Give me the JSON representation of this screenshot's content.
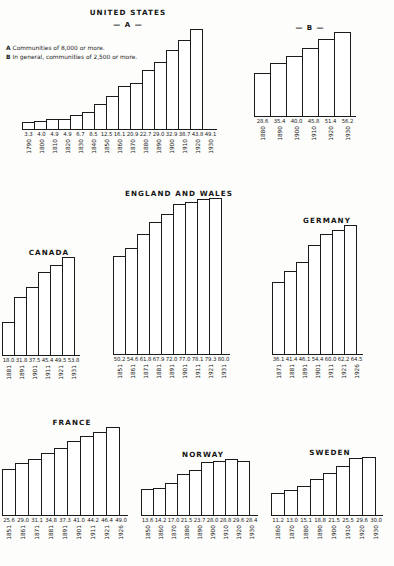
{
  "legend": {
    "lines": [
      {
        "key": "A",
        "text": "Communities of 8,000 or more."
      },
      {
        "key": "B",
        "text": "In general, communities of 2,500 or more."
      }
    ]
  },
  "chart_data": [
    {
      "type": "bar",
      "title": "UNITED STATES",
      "subtitle": "— A —",
      "xlabel": "",
      "ylabel": "Per cent urban",
      "ylim": [
        0,
        56.2
      ],
      "grid": false,
      "legend": "none",
      "categories": [
        "1790",
        "1800",
        "1810",
        "1820",
        "1830",
        "1840",
        "1850",
        "1860",
        "1870",
        "1880",
        "1890",
        "1900",
        "1910",
        "1920",
        "1930"
      ],
      "values": [
        3.3,
        4.0,
        4.9,
        4.9,
        6.7,
        8.5,
        12.5,
        16.1,
        20.9,
        22.7,
        29.0,
        32.9,
        38.7,
        43.8,
        49.1
      ]
    },
    {
      "type": "bar",
      "title": "",
      "subtitle": "— B —",
      "xlabel": "",
      "ylabel": "Per cent urban",
      "ylim": [
        0,
        56.2
      ],
      "grid": false,
      "legend": "none",
      "categories": [
        "1880",
        "1890",
        "1900",
        "1910",
        "1920",
        "1930"
      ],
      "values": [
        28.6,
        35.4,
        40.0,
        45.8,
        51.4,
        56.2
      ]
    },
    {
      "type": "bar",
      "title": "CANADA",
      "subtitle": "",
      "xlabel": "",
      "ylabel": "Per cent urban",
      "ylim": [
        0,
        80.0
      ],
      "grid": false,
      "legend": "none",
      "categories": [
        "1881",
        "1891",
        "1901",
        "1911",
        "1921",
        "1931"
      ],
      "values": [
        18.0,
        31.8,
        37.5,
        45.4,
        49.5,
        53.8
      ]
    },
    {
      "type": "bar",
      "title": "ENGLAND AND WALES",
      "subtitle": "",
      "xlabel": "",
      "ylabel": "Per cent urban",
      "ylim": [
        0,
        80.0
      ],
      "grid": false,
      "legend": "none",
      "categories": [
        "1851",
        "1861",
        "1871",
        "1881",
        "1891",
        "1901",
        "1911",
        "1921",
        "1931"
      ],
      "values": [
        50.2,
        54.6,
        61.8,
        67.9,
        72.0,
        77.0,
        78.1,
        79.3,
        80.0
      ]
    },
    {
      "type": "bar",
      "title": "GERMANY",
      "subtitle": "",
      "xlabel": "",
      "ylabel": "Per cent urban",
      "ylim": [
        0,
        80.0
      ],
      "grid": false,
      "legend": "none",
      "categories": [
        "1871",
        "1881",
        "1891",
        "1901",
        "1911",
        "1921",
        "1926"
      ],
      "values": [
        36.1,
        41.4,
        46.1,
        54.4,
        60.0,
        62.2,
        64.5
      ]
    },
    {
      "type": "bar",
      "title": "FRANCE",
      "subtitle": "",
      "xlabel": "",
      "ylabel": "Per cent urban",
      "ylim": [
        0,
        49.0
      ],
      "grid": false,
      "legend": "none",
      "categories": [
        "1851",
        "1861",
        "1871",
        "1881",
        "1891",
        "1901",
        "1911",
        "1921",
        "1926"
      ],
      "values": [
        25.6,
        29.0,
        31.1,
        34.8,
        37.3,
        41.0,
        44.2,
        46.4,
        49.0
      ]
    },
    {
      "type": "bar",
      "title": "NORWAY",
      "subtitle": "",
      "xlabel": "",
      "ylabel": "Per cent urban",
      "ylim": [
        0,
        29.6
      ],
      "grid": false,
      "legend": "none",
      "categories": [
        "1850",
        "1860",
        "1870",
        "1880",
        "1890",
        "1900",
        "1910",
        "1920",
        "1930"
      ],
      "values": [
        13.6,
        14.2,
        17.0,
        21.5,
        23.7,
        28.0,
        28.8,
        29.6,
        28.4
      ]
    },
    {
      "type": "bar",
      "title": "SWEDEN",
      "subtitle": "",
      "xlabel": "",
      "ylabel": "Per cent urban",
      "ylim": [
        0,
        30.0
      ],
      "grid": false,
      "legend": "none",
      "categories": [
        "1860",
        "1870",
        "1880",
        "1890",
        "1900",
        "1910",
        "1920",
        "1930"
      ],
      "values": [
        11.2,
        13.0,
        15.1,
        18.8,
        21.5,
        25.5,
        29.6,
        30.0
      ]
    }
  ],
  "panels": {
    "us_a": {
      "title": "UNITED STATES",
      "subtitle": "— A —"
    },
    "us_b": {
      "subtitle": "— B —"
    },
    "canada": {
      "title": "CANADA"
    },
    "england": {
      "title": "ENGLAND AND WALES"
    },
    "germany": {
      "title": "GERMANY"
    },
    "france": {
      "title": "FRANCE"
    },
    "norway": {
      "title": "NORWAY"
    },
    "sweden": {
      "title": "SWEDEN"
    }
  },
  "style": {
    "ink": "#1b1b1b",
    "paper": "#fdfdfb",
    "bar_fill": "#ffffff"
  }
}
